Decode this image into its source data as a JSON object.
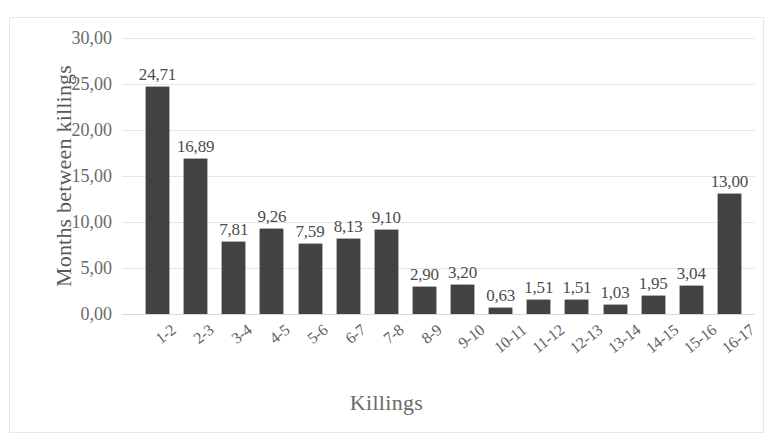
{
  "chart_data": {
    "type": "bar",
    "title": "",
    "xlabel": "Killings",
    "ylabel": "Months between killings",
    "categories": [
      "1-2",
      "2-3",
      "3-4",
      "4-5",
      "5-6",
      "6-7",
      "7-8",
      "8-9",
      "9-10",
      "10-11",
      "11-12",
      "12-13",
      "13-14",
      "14-15",
      "15-16",
      "16-17"
    ],
    "values": [
      24.71,
      16.89,
      7.81,
      9.26,
      7.59,
      8.13,
      9.1,
      2.9,
      3.2,
      0.63,
      1.51,
      1.51,
      1.03,
      1.95,
      3.04,
      13.0
    ],
    "value_labels": [
      "24,71",
      "16,89",
      "7,81",
      "9,26",
      "7,59",
      "8,13",
      "9,10",
      "2,90",
      "3,20",
      "0,63",
      "1,51",
      "1,51",
      "1,03",
      "1,95",
      "3,04",
      "13,00"
    ],
    "ylim": [
      0,
      30
    ],
    "ytick_values": [
      0,
      5,
      10,
      15,
      20,
      25,
      30
    ],
    "ytick_labels": [
      "0,00",
      "5,00",
      "10,00",
      "15,00",
      "20,00",
      "25,00",
      "30,00"
    ],
    "grid": "horizontal",
    "legend": "none",
    "bar_color": "#424242",
    "gridline_color": "#e6e6e6",
    "decimal_separator": ","
  },
  "frame": {
    "border_color": "#e8e8e8",
    "background": "#ffffff"
  }
}
